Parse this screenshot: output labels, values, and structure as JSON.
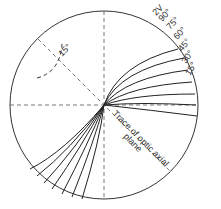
{
  "diagram": {
    "title": "",
    "angle_labels": [
      "15°",
      "30°",
      "45°",
      "60°",
      "75°",
      "90°"
    ],
    "two_v_label": "2V",
    "arc_label": "15°",
    "trace_label_line1": "Trace of optic axial",
    "trace_label_line2": "plane",
    "colors": {
      "line": "#333333",
      "background": "#ffffff"
    }
  }
}
